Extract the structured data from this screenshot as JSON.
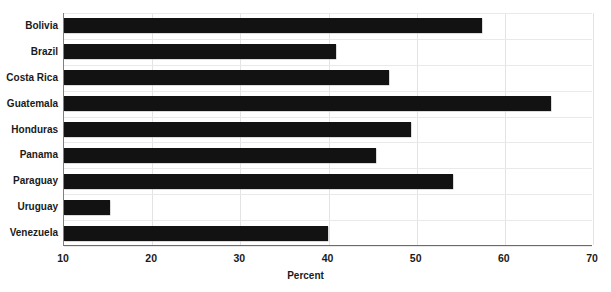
{
  "chart_data": {
    "type": "bar",
    "orientation": "horizontal",
    "title": "",
    "xlabel": "Percent",
    "ylabel": "",
    "categories": [
      "Bolivia",
      "Brazil",
      "Costa Rica",
      "Guatemala",
      "Honduras",
      "Panama",
      "Paraguay",
      "Uruguay",
      "Venezuela"
    ],
    "values": [
      57.5,
      41.0,
      47.0,
      65.3,
      49.5,
      45.5,
      54.2,
      15.3,
      40.0
    ],
    "xlim": [
      10,
      70
    ],
    "xticks": [
      10,
      20,
      30,
      40,
      50,
      60,
      70
    ],
    "xtick_labels": [
      "10",
      "20",
      "30",
      "40",
      "50",
      "60",
      "70"
    ],
    "grid": "both",
    "legend": "none",
    "bar_color": "#121212",
    "grid_color": "#e3e3e6",
    "axis_color": "#6b6b6b",
    "text_color": "#1a1a1a"
  }
}
